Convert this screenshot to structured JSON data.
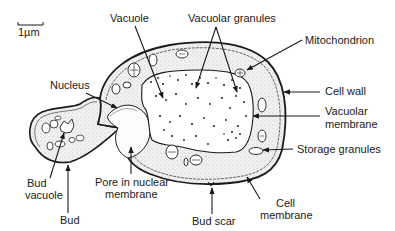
{
  "scale_bar": {
    "label": "1µm"
  },
  "labels": {
    "vacuole": "Vacuole",
    "vacuolar_granules": "Vacuolar granules",
    "mitochondrion": "Mitochondrion",
    "nucleus": "Nucleus",
    "cell_wall": "Cell wall",
    "vacuolar_membrane_line1": "Vacuolar",
    "vacuolar_membrane_line2": "membrane",
    "storage_granules": "Storage granules",
    "bud_vacuole_line1": "Bud",
    "bud_vacuole_line2": "vacuole",
    "pore_line1": "Pore in nuclear",
    "pore_line2": "membrane",
    "cell_membrane_line1": "Cell",
    "cell_membrane_line2": "membrane",
    "bud": "Bud",
    "bud_scar": "Bud scar"
  },
  "colors": {
    "ink": "#1a1a1a",
    "cytoplasm": "#ececec",
    "vacuole_fill": "#ffffff"
  }
}
